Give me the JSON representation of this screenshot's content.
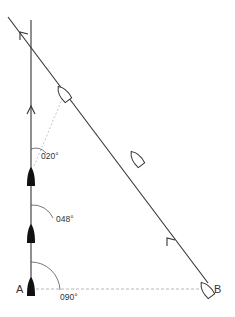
{
  "diagram": {
    "points": {
      "a_label": "A",
      "b_label": "B"
    },
    "bearings": [
      {
        "label": "020°",
        "value": 20
      },
      {
        "label": "048°",
        "value": 48
      },
      {
        "label": "090°",
        "value": 90
      }
    ],
    "boats": {
      "own_vessel": [
        "A (start)",
        "middle",
        "upper"
      ],
      "other_vessel": [
        "B (start)",
        "middle",
        "upper"
      ]
    },
    "colors": {
      "line": "#333333",
      "sight_line": "#b8b8b8",
      "own_boat_fill": "#111111",
      "other_boat_fill": "#ffffff"
    }
  }
}
